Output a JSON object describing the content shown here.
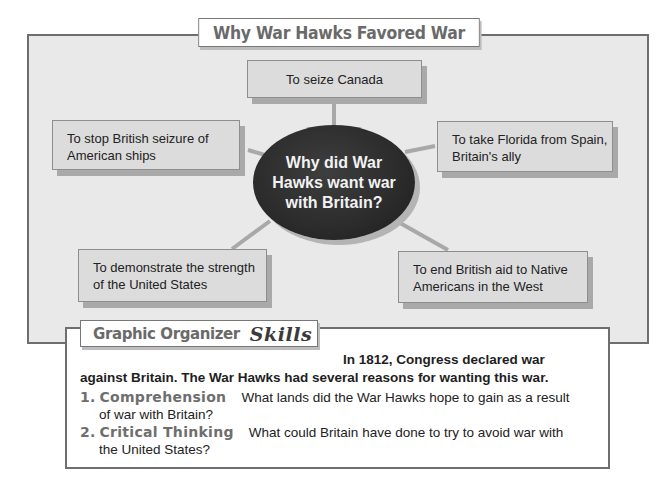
{
  "title": "Why War Hawks Favored War",
  "hub": {
    "text": "Why did War Hawks want war with Britain?"
  },
  "nodes": {
    "top": "To seize Canada",
    "left": "To stop British seizure of American ships",
    "right": "To take Florida from Spain, Britain's ally",
    "bottom_left": "To demonstrate the strength of the United States",
    "bottom_right": "To end British aid to Native Americans in the West"
  },
  "skills": {
    "label": "Graphic Organizer",
    "script_label": "Skills",
    "intro_part1": "In 1812, Congress declared war",
    "intro_part2": "against Britain. The War Hawks had several reasons for wanting this war.",
    "questions": [
      {
        "number": "1.",
        "heading": "Comprehension",
        "text_line1": "What lands did the War Hawks hope to gain as a result",
        "text_line2": "of war with Britain?"
      },
      {
        "number": "2.",
        "heading": "Critical Thinking",
        "text_line1": "What could Britain have done to try to avoid war with",
        "text_line2": "the United  States?"
      }
    ]
  },
  "colors": {
    "frame_background": "#e9e9e9",
    "node_background": "#dcdcdc",
    "hub_background": "#2b2b2b",
    "connector": "#a8a8a8",
    "heading_gray": "#6a6a6a"
  }
}
